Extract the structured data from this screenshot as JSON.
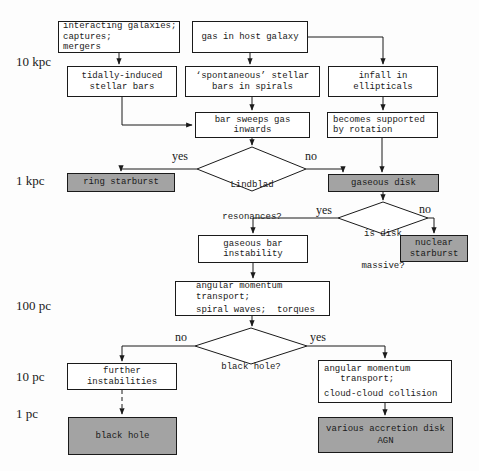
{
  "colors": {
    "page_bg": "#fdfdfd",
    "box_bg": "#ffffff",
    "shaded": "#a3a3a3",
    "line": "#1a1a1a"
  },
  "scale_labels": {
    "kpc10": "10 kpc",
    "kpc1": "1 kpc",
    "pc100": "100 pc",
    "pc10": "10 pc",
    "pc1": "1 pc"
  },
  "branch_labels": {
    "yes": "yes",
    "no": "no"
  },
  "nodes": {
    "interacting": {
      "lines": [
        "interacting galaxies;",
        "captures;",
        "mergers"
      ]
    },
    "gas_host": {
      "lines": [
        "gas in host galaxy"
      ]
    },
    "tidally": {
      "lines": [
        "tidally-induced",
        "stellar bars"
      ]
    },
    "spontaneous": {
      "lines": [
        "‘spontaneous’ stellar",
        "bars in spirals"
      ]
    },
    "infall": {
      "lines": [
        "infall in",
        "ellipticals"
      ]
    },
    "bar_sweeps": {
      "lines": [
        "bar sweeps gas",
        "inwards"
      ]
    },
    "becomes": {
      "lines": [
        "becomes supported",
        "by rotation"
      ]
    },
    "ring": {
      "lines": [
        "ring starburst"
      ]
    },
    "gaseous_disk": {
      "lines": [
        "gaseous disk"
      ]
    },
    "nuclear": {
      "lines": [
        "nuclear",
        "starburst"
      ]
    },
    "gaseous_bar": {
      "lines": [
        "gaseous bar",
        "instability"
      ]
    },
    "amt_spiral": {
      "lines": [
        "angular momentum",
        "transport;",
        "spiral waves;  torques"
      ]
    },
    "further": {
      "lines": [
        "further",
        "instabilities"
      ]
    },
    "amt_cloud": {
      "lines": [
        "angular momentum",
        "   transport;",
        "cloud-cloud collision"
      ]
    },
    "black_hole": {
      "lines": [
        "black hole"
      ]
    },
    "various": {
      "lines": [
        "various accretion disk",
        "AGN"
      ]
    }
  },
  "decisions": {
    "lindblad": {
      "lines": [
        "Lindblad",
        "resonances?"
      ]
    },
    "disk_massive": {
      "lines": [
        "is disk",
        "massive?"
      ]
    },
    "black_hole_q": {
      "lines": [
        "black hole?"
      ]
    }
  }
}
